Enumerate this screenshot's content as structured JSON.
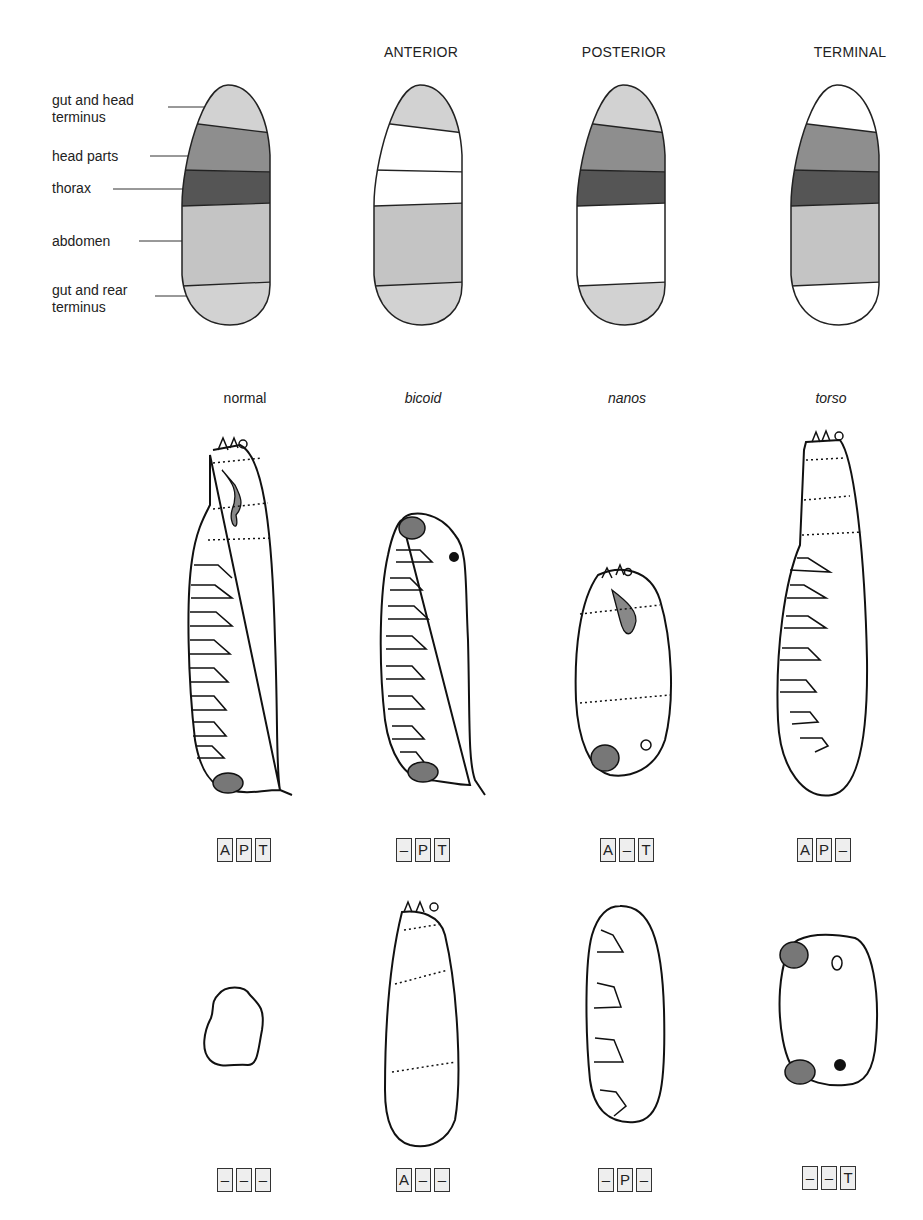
{
  "columns": [
    {
      "id": "normal",
      "header": "",
      "mutant": "normal",
      "italic": false,
      "x": 232,
      "genotype": [
        "A",
        "P",
        "T"
      ],
      "double_genotype": [
        "–",
        "–",
        "–"
      ]
    },
    {
      "id": "anterior",
      "header": "ANTERIOR",
      "mutant": "bicoid",
      "italic": true,
      "x": 421,
      "genotype": [
        "–",
        "P",
        "T"
      ],
      "double_genotype": [
        "A",
        "–",
        "–"
      ]
    },
    {
      "id": "posterior",
      "header": "POSTERIOR",
      "mutant": "nanos",
      "italic": true,
      "x": 624,
      "genotype": [
        "A",
        "–",
        "T"
      ],
      "double_genotype": [
        "–",
        "P",
        "–"
      ]
    },
    {
      "id": "terminal",
      "header": "TERMINAL",
      "mutant": "torso",
      "italic": true,
      "x": 831,
      "genotype": [
        "A",
        "P",
        "–"
      ],
      "double_genotype": [
        "–",
        "–",
        "T"
      ]
    }
  ],
  "region_labels": [
    {
      "text": "gut and head\nterminus",
      "y": 92,
      "line_y": 110
    },
    {
      "text": "head parts",
      "y": 148,
      "line_y": 156
    },
    {
      "text": "thorax",
      "y": 180,
      "line_y": 188
    },
    {
      "text": "abdomen",
      "y": 233,
      "line_y": 241
    },
    {
      "text": "gut and rear\nterminus",
      "y": 282,
      "line_y": 295
    }
  ],
  "fate_map_colors": {
    "terminus": "#d2d2d2",
    "head": "#8e8e8e",
    "thorax": "#555555",
    "abdomen": "#c4c4c4",
    "absent": "#ffffff"
  },
  "fate_maps": [
    {
      "id": "normal",
      "bands": [
        "terminus",
        "head",
        "thorax",
        "abdomen",
        "terminus"
      ]
    },
    {
      "id": "anterior",
      "bands": [
        "terminus",
        "absent",
        "absent",
        "abdomen",
        "terminus"
      ]
    },
    {
      "id": "posterior",
      "bands": [
        "terminus",
        "head",
        "thorax",
        "absent",
        "terminus"
      ]
    },
    {
      "id": "terminal",
      "bands": [
        "absent",
        "head",
        "thorax",
        "abdomen",
        "absent"
      ]
    }
  ]
}
